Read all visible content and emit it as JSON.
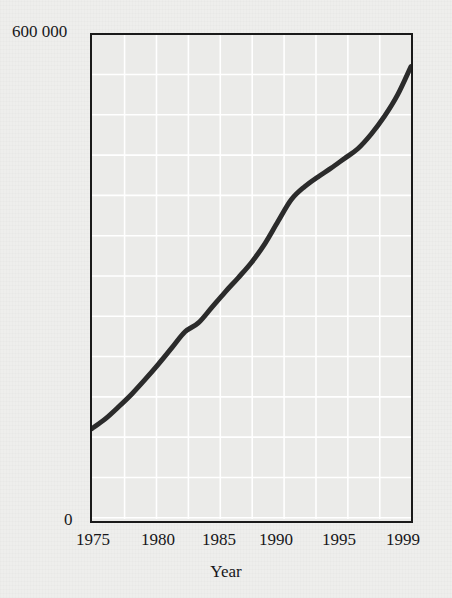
{
  "figure": {
    "background_color": "#eeeeec",
    "plot_background_color": "#ebebe9",
    "frame_color": "#1a1a1a",
    "grid_color": "#ffffff",
    "line_color": "#2b2b2b"
  },
  "axes": {
    "y_max_label": "600 000",
    "y_min_label": "0",
    "y_title": "Total personal disposable income",
    "x_title": "Year",
    "x_ticks": [
      {
        "label": "1975",
        "x_px": 93
      },
      {
        "label": "1980",
        "x_px": 158
      },
      {
        "label": "1985",
        "x_px": 219
      },
      {
        "label": "1990",
        "x_px": 276
      },
      {
        "label": "1995",
        "x_px": 339
      },
      {
        "label": "1999",
        "x_px": 403
      }
    ]
  },
  "chart_data": {
    "type": "line",
    "title": "",
    "subtitle": "",
    "xlabel": "Year",
    "ylabel": "Total personal disposable income",
    "xlim": [
      1975,
      1999
    ],
    "ylim": [
      0,
      600000
    ],
    "x_tick_labels": [
      "1975",
      "1980",
      "1985",
      "1990",
      "1995",
      "1999"
    ],
    "y_tick_labels": [
      "0",
      "600 000"
    ],
    "grid": true,
    "grid_orientation": "both",
    "legend": null,
    "annotations": [],
    "series": [
      {
        "name": "Total personal disposable income",
        "color": "#2b2b2b",
        "line_width_px": 5,
        "x": [
          1975,
          1976,
          1977,
          1978,
          1979,
          1980,
          1981,
          1982,
          1983,
          1984,
          1985,
          1986,
          1987,
          1988,
          1989,
          1990,
          1991,
          1992,
          1993,
          1994,
          1995,
          1996,
          1997,
          1998,
          1999
        ],
        "values": [
          112000,
          124000,
          139000,
          155000,
          173000,
          192000,
          212000,
          232000,
          243000,
          262000,
          281000,
          299000,
          318000,
          341000,
          369000,
          396000,
          412000,
          424000,
          435000,
          447000,
          459000,
          477000,
          499000,
          526000,
          561000
        ]
      }
    ]
  }
}
